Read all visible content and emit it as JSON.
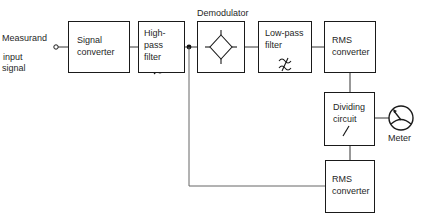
{
  "diagram": {
    "input": {
      "label_line1": "Measurand",
      "label_line2": "input",
      "label_line3": "signal"
    },
    "blocks": {
      "signal_converter": {
        "line1": "Signal",
        "line2": "converter"
      },
      "high_pass_filter": {
        "line1": "High-pass",
        "line2": "filter",
        "icon": "high-pass-filter-icon"
      },
      "demodulator": {
        "label": "Demodulator",
        "icon": "diode-bridge-icon"
      },
      "low_pass_filter": {
        "line1": "Low-pass",
        "line2": "filter",
        "icon": "low-pass-filter-icon"
      },
      "rms_converter_top": {
        "line1": "RMS",
        "line2": "converter"
      },
      "dividing_circuit": {
        "line1": "Dividing",
        "line2": "circuit",
        "icon": "slash-icon"
      },
      "rms_converter_bottom": {
        "line1": "RMS",
        "line2": "converter"
      }
    },
    "output": {
      "label": "Meter",
      "icon": "meter-icon"
    }
  }
}
